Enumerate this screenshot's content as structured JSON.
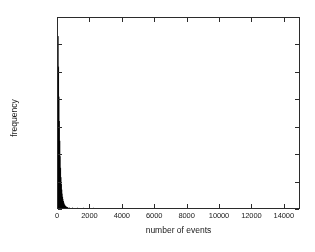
{
  "chart_data": {
    "type": "bar",
    "title": "",
    "subtitle": "",
    "xlabel": "number of events",
    "ylabel": "frequency",
    "xlim": [
      0,
      15000
    ],
    "ylim": [
      0,
      14000
    ],
    "xticks": [
      0,
      2000,
      4000,
      6000,
      8000,
      10000,
      12000,
      14000
    ],
    "yticks": [
      0,
      2000,
      4000,
      6000,
      8000,
      10000,
      12000,
      14000
    ],
    "xtick_labels": [
      "0",
      "2000",
      "4000",
      "6000",
      "8000",
      "10000",
      "12000",
      "14000"
    ],
    "ytick_labels": [
      "0",
      "2000",
      "4000",
      "6000",
      "8000",
      "10000",
      "12000",
      "14000"
    ],
    "grid": false,
    "legend": null,
    "legend_position": "none",
    "bar_color": "#000000",
    "frame_color": "#2b2b2b",
    "background_color": "#ffffff",
    "annotations": [],
    "bin_width": 25,
    "categories": [
      12,
      37,
      62,
      87,
      112,
      137,
      162,
      187,
      212,
      237,
      262,
      287,
      312,
      337,
      362,
      387,
      412,
      437,
      462,
      487,
      512,
      537,
      562,
      587,
      612,
      700,
      900,
      1200,
      1600,
      2200
    ],
    "values": [
      12650,
      10400,
      8200,
      6400,
      4950,
      3800,
      2950,
      2250,
      1750,
      1350,
      1050,
      820,
      640,
      500,
      390,
      300,
      235,
      185,
      145,
      115,
      90,
      70,
      55,
      44,
      35,
      22,
      12,
      6,
      3,
      1
    ]
  }
}
